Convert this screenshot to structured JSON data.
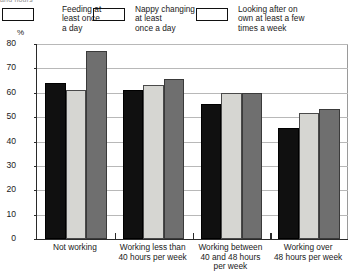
{
  "title_remnant": "and hours",
  "axis": {
    "y_unit": "%",
    "ticks": [
      "80",
      "70",
      "60",
      "50",
      "40",
      "30",
      "20",
      "10",
      "0"
    ]
  },
  "legend": [
    {
      "label": "Feeding at least once a day",
      "lines": [
        "Feeding at",
        "least once",
        "a day"
      ],
      "color": "#101010",
      "swatch_name": "legend-swatch-feeding"
    },
    {
      "label": "Nappy changing at least once a day",
      "lines": [
        "Nappy changing",
        "at least",
        "once a day"
      ],
      "color": "#d6d6d2",
      "swatch_name": "legend-swatch-nappy"
    },
    {
      "label": "Looking after on own at least a few times a week",
      "lines": [
        "Looking after on",
        "own at least a few",
        "times a week"
      ],
      "color": "#6f6f6f",
      "swatch_name": "legend-swatch-looking-after"
    }
  ],
  "categories_lines": [
    [
      "Not working"
    ],
    [
      "Working less than",
      "40 hours per week"
    ],
    [
      "Working between",
      "40 and 48 hours",
      "per week"
    ],
    [
      "Working over",
      "48 hours per week"
    ]
  ],
  "chart_data": {
    "type": "bar",
    "title": "",
    "xlabel": "",
    "ylabel": "%",
    "ylim": [
      0,
      80
    ],
    "ytick_step": 10,
    "grid": true,
    "legend_position": "top",
    "categories": [
      "Not working",
      "Working less than 40 hours per week",
      "Working between 40 and 48 hours per week",
      "Working over 48 hours per week"
    ],
    "series": [
      {
        "name": "Feeding at least once a day",
        "color": "#101010",
        "values": [
          64,
          61,
          55.5,
          45.5
        ]
      },
      {
        "name": "Nappy changing at least once a day",
        "color": "#d6d6d2",
        "values": [
          61,
          63,
          60,
          51.5
        ]
      },
      {
        "name": "Looking after on own at least a few times a week",
        "color": "#6f6f6f",
        "values": [
          77,
          65.5,
          60,
          53.5
        ]
      }
    ]
  }
}
